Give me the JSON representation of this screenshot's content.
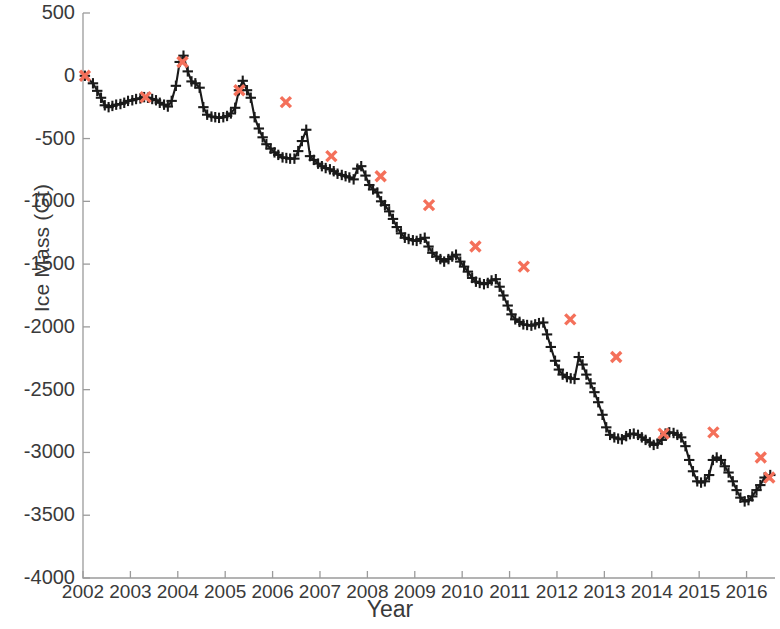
{
  "chart_data": {
    "type": "line",
    "title": "",
    "xlabel": "Year",
    "ylabel": "Ice Mass (Gt)",
    "xlim": [
      2002.0,
      2016.6
    ],
    "ylim": [
      -4000,
      500
    ],
    "grid": false,
    "legend": null,
    "xticks": [
      2002,
      2003,
      2004,
      2005,
      2006,
      2007,
      2008,
      2009,
      2010,
      2011,
      2012,
      2013,
      2014,
      2015,
      2016
    ],
    "yticks": [
      500,
      0,
      -500,
      -1000,
      -1500,
      -2000,
      -2500,
      -3000,
      -3500,
      -4000
    ],
    "ytick_labels": [
      "500",
      "0",
      "-500",
      "-1000",
      "-1500",
      "-2000",
      "-2500",
      "-3000",
      "-3500",
      "-4000"
    ],
    "xtick_labels": [
      "2002",
      "2003",
      "2004",
      "2005",
      "2006",
      "2007",
      "2008",
      "2009",
      "2010",
      "2011",
      "2012",
      "2013",
      "2014",
      "2015",
      "2016"
    ],
    "line_color": "#1a1a1a",
    "marker_color": "#1a1a1a",
    "marker_symbol": "plus",
    "highlight_color": "#f4705a",
    "highlight_symbol": "cross",
    "series": [
      {
        "name": "Ice Mass",
        "marker": "plus",
        "x": [
          2002.04,
          2002.21,
          2002.3,
          2002.38,
          2002.46,
          2002.54,
          2002.62,
          2002.7,
          2002.79,
          2002.87,
          2002.95,
          2003.04,
          2003.12,
          2003.21,
          2003.29,
          2003.37,
          2003.46,
          2003.54,
          2003.62,
          2003.71,
          2003.79,
          2003.87,
          2003.96,
          2004.04,
          2004.12,
          2004.21,
          2004.29,
          2004.37,
          2004.46,
          2004.54,
          2004.62,
          2004.71,
          2004.79,
          2004.87,
          2004.96,
          2005.04,
          2005.12,
          2005.21,
          2005.29,
          2005.37,
          2005.46,
          2005.54,
          2005.62,
          2005.71,
          2005.79,
          2005.87,
          2005.96,
          2006.04,
          2006.12,
          2006.21,
          2006.29,
          2006.37,
          2006.46,
          2006.54,
          2006.62,
          2006.71,
          2006.79,
          2006.87,
          2006.96,
          2007.04,
          2007.12,
          2007.21,
          2007.29,
          2007.37,
          2007.46,
          2007.54,
          2007.62,
          2007.71,
          2007.79,
          2007.87,
          2007.96,
          2008.04,
          2008.12,
          2008.21,
          2008.29,
          2008.37,
          2008.46,
          2008.54,
          2008.62,
          2008.71,
          2008.79,
          2008.87,
          2008.96,
          2009.04,
          2009.12,
          2009.21,
          2009.29,
          2009.37,
          2009.46,
          2009.54,
          2009.62,
          2009.71,
          2009.79,
          2009.87,
          2009.96,
          2010.04,
          2010.12,
          2010.21,
          2010.29,
          2010.37,
          2010.46,
          2010.54,
          2010.62,
          2010.71,
          2010.79,
          2010.87,
          2010.96,
          2011.04,
          2011.12,
          2011.21,
          2011.29,
          2011.37,
          2011.46,
          2011.54,
          2011.62,
          2011.71,
          2011.79,
          2011.87,
          2011.96,
          2012.04,
          2012.12,
          2012.21,
          2012.29,
          2012.37,
          2012.46,
          2012.54,
          2012.62,
          2012.71,
          2012.79,
          2012.87,
          2012.96,
          2013.04,
          2013.12,
          2013.21,
          2013.29,
          2013.37,
          2013.46,
          2013.54,
          2013.62,
          2013.71,
          2013.79,
          2013.87,
          2013.96,
          2014.04,
          2014.12,
          2014.21,
          2014.29,
          2014.37,
          2014.46,
          2014.54,
          2014.62,
          2014.71,
          2014.79,
          2014.87,
          2014.96,
          2015.04,
          2015.12,
          2015.21,
          2015.29,
          2015.37,
          2015.46,
          2015.54,
          2015.62,
          2015.71,
          2015.79,
          2015.87,
          2015.96,
          2016.04,
          2016.12,
          2016.21,
          2016.29,
          2016.38,
          2016.5
        ],
        "y": [
          0,
          -60,
          -120,
          -175,
          -235,
          -250,
          -240,
          -230,
          -225,
          -215,
          -200,
          -195,
          -185,
          -180,
          -170,
          -175,
          -185,
          -195,
          -215,
          -230,
          -245,
          -200,
          -80,
          110,
          160,
          35,
          -45,
          -60,
          -95,
          -250,
          -310,
          -325,
          -330,
          -335,
          -330,
          -320,
          -300,
          -255,
          -115,
          -40,
          -115,
          -175,
          -330,
          -420,
          -490,
          -545,
          -580,
          -610,
          -630,
          -650,
          -655,
          -660,
          -660,
          -600,
          -520,
          -430,
          -640,
          -670,
          -700,
          -720,
          -735,
          -745,
          -760,
          -780,
          -790,
          -800,
          -810,
          -825,
          -740,
          -720,
          -795,
          -870,
          -905,
          -930,
          -1000,
          -1030,
          -1080,
          -1140,
          -1205,
          -1255,
          -1290,
          -1300,
          -1310,
          -1315,
          -1300,
          -1290,
          -1360,
          -1410,
          -1440,
          -1460,
          -1480,
          -1460,
          -1440,
          -1425,
          -1480,
          -1520,
          -1560,
          -1610,
          -1640,
          -1650,
          -1660,
          -1650,
          -1630,
          -1620,
          -1680,
          -1750,
          -1830,
          -1900,
          -1940,
          -1960,
          -1980,
          -1985,
          -1990,
          -1980,
          -1970,
          -1965,
          -2060,
          -2160,
          -2270,
          -2340,
          -2380,
          -2400,
          -2410,
          -2415,
          -2240,
          -2300,
          -2380,
          -2450,
          -2520,
          -2600,
          -2700,
          -2800,
          -2860,
          -2880,
          -2890,
          -2895,
          -2870,
          -2855,
          -2850,
          -2860,
          -2880,
          -2900,
          -2920,
          -2940,
          -2930,
          -2900,
          -2850,
          -2840,
          -2845,
          -2860,
          -2880,
          -2950,
          -3060,
          -3150,
          -3230,
          -3240,
          -3230,
          -3180,
          -3060,
          -3040,
          -3060,
          -3110,
          -3160,
          -3230,
          -3300,
          -3360,
          -3390,
          -3380,
          -3350,
          -3300,
          -3260,
          -3200,
          -3180
        ]
      }
    ],
    "annual_maxima": {
      "name": "Annual spring maximum",
      "marker": "cross",
      "color": "#f4705a",
      "x": [
        2002.04,
        2003.32,
        2004.1,
        2005.3,
        2006.28,
        2007.24,
        2008.28,
        2009.3,
        2010.28,
        2011.3,
        2012.28,
        2013.25,
        2014.25,
        2015.3,
        2016.3,
        2016.48
      ],
      "y": [
        0,
        -170,
        110,
        -115,
        -210,
        -640,
        -800,
        -1030,
        -1360,
        -1520,
        -1940,
        -2240,
        -2850,
        -2840,
        -3040,
        -3200
      ]
    }
  }
}
